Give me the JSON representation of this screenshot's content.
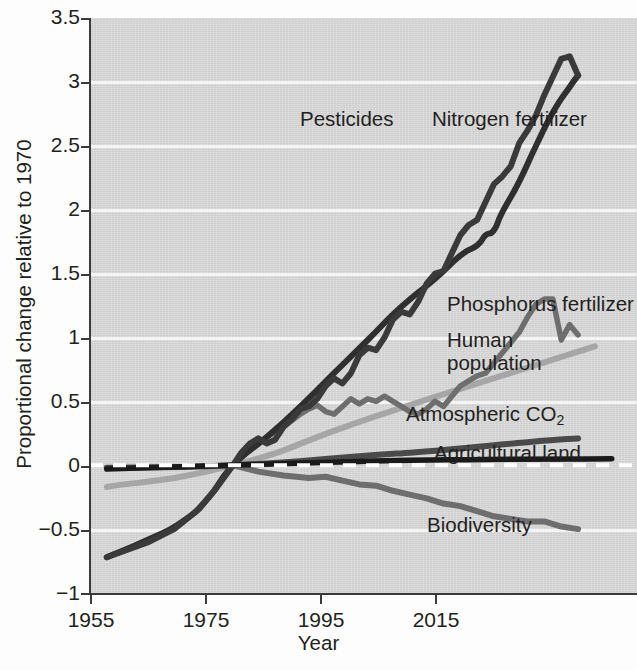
{
  "chart_data": {
    "type": "line",
    "title": "",
    "xlabel": "Year",
    "ylabel": "Proportional change relative to 1970",
    "xlim": [
      1953,
      2018
    ],
    "ylim": [
      -1,
      3.5
    ],
    "xticks": [
      1955,
      1975,
      1995,
      2015
    ],
    "yticks": [
      "-1",
      "-0.5",
      "0",
      "0.5",
      "1",
      "1.5",
      "2",
      "2.5",
      "3",
      "3.5"
    ],
    "grid": "horizontal-white",
    "legend": "inline-annotations",
    "baseline_year": 1970,
    "series": [
      {
        "name": "Pesticides",
        "color": "#3a3a3a",
        "label_x": 300,
        "label_y": 120,
        "points": [
          [
            1955,
            -0.72
          ],
          [
            1960,
            -0.6
          ],
          [
            1963,
            -0.5
          ],
          [
            1966,
            -0.34
          ],
          [
            1968,
            -0.18
          ],
          [
            1970,
            0.0
          ],
          [
            1971,
            0.1
          ],
          [
            1972,
            0.17
          ],
          [
            1973,
            0.21
          ],
          [
            1974,
            0.17
          ],
          [
            1975,
            0.2
          ],
          [
            1976,
            0.3
          ],
          [
            1977,
            0.36
          ],
          [
            1978,
            0.44
          ],
          [
            1979,
            0.46
          ],
          [
            1980,
            0.52
          ],
          [
            1981,
            0.62
          ],
          [
            1982,
            0.68
          ],
          [
            1983,
            0.64
          ],
          [
            1984,
            0.72
          ],
          [
            1985,
            0.86
          ],
          [
            1986,
            0.92
          ],
          [
            1987,
            0.9
          ],
          [
            1988,
            1.0
          ],
          [
            1989,
            1.14
          ],
          [
            1990,
            1.2
          ],
          [
            1991,
            1.18
          ],
          [
            1992,
            1.28
          ],
          [
            1993,
            1.42
          ],
          [
            1994,
            1.5
          ],
          [
            1995,
            1.52
          ],
          [
            1996,
            1.66
          ],
          [
            1997,
            1.8
          ],
          [
            1998,
            1.88
          ],
          [
            1999,
            1.92
          ],
          [
            2000,
            2.06
          ],
          [
            2001,
            2.2
          ],
          [
            2002,
            2.26
          ],
          [
            2003,
            2.34
          ],
          [
            2004,
            2.52
          ],
          [
            2005,
            2.62
          ],
          [
            2006,
            2.74
          ],
          [
            2007,
            2.9
          ],
          [
            2008,
            3.04
          ],
          [
            2009,
            3.18
          ],
          [
            2010,
            3.2
          ],
          [
            2011,
            3.05
          ]
        ]
      },
      {
        "name": "Nitrogen fertilizer",
        "color": "#2f2f2f",
        "label_x": 432,
        "label_y": 120,
        "points": [
          [
            1955,
            -0.72
          ],
          [
            1960,
            -0.58
          ],
          [
            1964,
            -0.44
          ],
          [
            1967,
            -0.26
          ],
          [
            1970,
            0.0
          ],
          [
            1974,
            0.22
          ],
          [
            1978,
            0.46
          ],
          [
            1982,
            0.72
          ],
          [
            1986,
            0.98
          ],
          [
            1990,
            1.24
          ],
          [
            1994,
            1.46
          ],
          [
            1997,
            1.64
          ],
          [
            1999,
            1.72
          ],
          [
            2000,
            1.8
          ],
          [
            2001,
            1.84
          ],
          [
            2002,
            1.98
          ],
          [
            2004,
            2.22
          ],
          [
            2006,
            2.5
          ],
          [
            2008,
            2.76
          ],
          [
            2010,
            2.96
          ],
          [
            2011,
            3.05
          ]
        ]
      },
      {
        "name": "Phosphorus fertilizer",
        "color": "#6e6e6e",
        "label_x": 447,
        "label_y": 305,
        "points": [
          [
            1970,
            0.0
          ],
          [
            1972,
            0.12
          ],
          [
            1974,
            0.22
          ],
          [
            1976,
            0.3
          ],
          [
            1978,
            0.4
          ],
          [
            1979,
            0.44
          ],
          [
            1980,
            0.47
          ],
          [
            1981,
            0.42
          ],
          [
            1982,
            0.4
          ],
          [
            1983,
            0.46
          ],
          [
            1984,
            0.52
          ],
          [
            1985,
            0.48
          ],
          [
            1986,
            0.52
          ],
          [
            1987,
            0.5
          ],
          [
            1988,
            0.54
          ],
          [
            1989,
            0.5
          ],
          [
            1990,
            0.46
          ],
          [
            1991,
            0.42
          ],
          [
            1992,
            0.4
          ],
          [
            1993,
            0.44
          ],
          [
            1994,
            0.5
          ],
          [
            1995,
            0.46
          ],
          [
            1996,
            0.54
          ],
          [
            1997,
            0.62
          ],
          [
            1998,
            0.66
          ],
          [
            1999,
            0.7
          ],
          [
            2000,
            0.72
          ],
          [
            2001,
            0.8
          ],
          [
            2002,
            0.88
          ],
          [
            2003,
            0.96
          ],
          [
            2004,
            1.04
          ],
          [
            2005,
            1.16
          ],
          [
            2006,
            1.26
          ],
          [
            2007,
            1.3
          ],
          [
            2008,
            1.3
          ],
          [
            2009,
            0.98
          ],
          [
            2010,
            1.1
          ],
          [
            2011,
            1.02
          ]
        ]
      },
      {
        "name": "Human population",
        "color": "#a6a6a6",
        "label_x": 447,
        "label_y": 341,
        "points": [
          [
            1955,
            -0.17
          ],
          [
            1970,
            0.0
          ],
          [
            1985,
            0.34
          ],
          [
            2000,
            0.66
          ],
          [
            2013,
            0.93
          ]
        ]
      },
      {
        "name": "Atmospheric CO2",
        "color": "#4a4a4a",
        "label_x": 406,
        "label_y": 413,
        "points": [
          [
            1955,
            -0.02
          ],
          [
            1970,
            0.0
          ],
          [
            1985,
            0.07
          ],
          [
            1995,
            0.12
          ],
          [
            2005,
            0.18
          ],
          [
            2011,
            0.21
          ]
        ]
      },
      {
        "name": "Agricultural land",
        "color": "#1a1a1a",
        "label_x": 434,
        "label_y": 452,
        "points": [
          [
            1955,
            -0.03
          ],
          [
            1970,
            0.0
          ],
          [
            1985,
            0.03
          ],
          [
            2000,
            0.045
          ],
          [
            2015,
            0.05
          ]
        ]
      },
      {
        "name": "Biodiversity",
        "color": "#6e6e6e",
        "label_x": 427,
        "label_y": 523,
        "points": [
          [
            1970,
            0.0
          ],
          [
            1973,
            -0.05
          ],
          [
            1976,
            -0.08
          ],
          [
            1979,
            -0.1
          ],
          [
            1981,
            -0.09
          ],
          [
            1983,
            -0.12
          ],
          [
            1985,
            -0.15
          ],
          [
            1987,
            -0.16
          ],
          [
            1989,
            -0.2
          ],
          [
            1991,
            -0.23
          ],
          [
            1993,
            -0.26
          ],
          [
            1995,
            -0.3
          ],
          [
            1997,
            -0.32
          ],
          [
            1999,
            -0.36
          ],
          [
            2001,
            -0.4
          ],
          [
            2003,
            -0.42
          ],
          [
            2005,
            -0.44
          ],
          [
            2007,
            -0.44
          ],
          [
            2009,
            -0.48
          ],
          [
            2011,
            -0.5
          ]
        ]
      }
    ],
    "reference_line": {
      "value": 0,
      "style": "dashed",
      "color": "#ffffff"
    }
  },
  "axes": {
    "y_title": "Proportional change relative to 1970",
    "x_title": "Year",
    "y_tick_labels": [
      "3.5",
      "3",
      "2.5",
      "2",
      "1.5",
      "1",
      "0.5",
      "0",
      "−0.5",
      "−1"
    ],
    "x_tick_labels": [
      "1955",
      "1975",
      "1995",
      "2015"
    ]
  },
  "annotations": {
    "pesticides": "Pesticides",
    "nitrogen": "Nitrogen fertilizer",
    "phosphorus": "Phosphorus fertilizer",
    "human_population_l1": "Human",
    "human_population_l2": "population",
    "atmospheric_co2_pre": "Atmospheric CO",
    "atmospheric_co2_sub": "2",
    "agricultural_land": "Agricultural land",
    "biodiversity": "Biodiversity"
  },
  "colors": {
    "plot_background": "#dcdcdc",
    "gridline": "#ffffff",
    "axis": "#3b3b3b",
    "text": "#231f20"
  }
}
